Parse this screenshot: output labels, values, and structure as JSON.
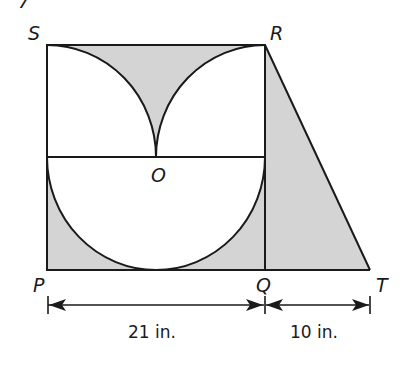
{
  "problem_number": "7",
  "points": {
    "S": "S",
    "R": "R",
    "P": "P",
    "Q": "Q",
    "T": "T",
    "O": "O"
  },
  "dimensions": {
    "PQ": "21 in.",
    "QT": "10 in."
  },
  "colors": {
    "shade": "#d4d4d4",
    "stroke": "#1a1a1a",
    "background": "#ffffff"
  }
}
